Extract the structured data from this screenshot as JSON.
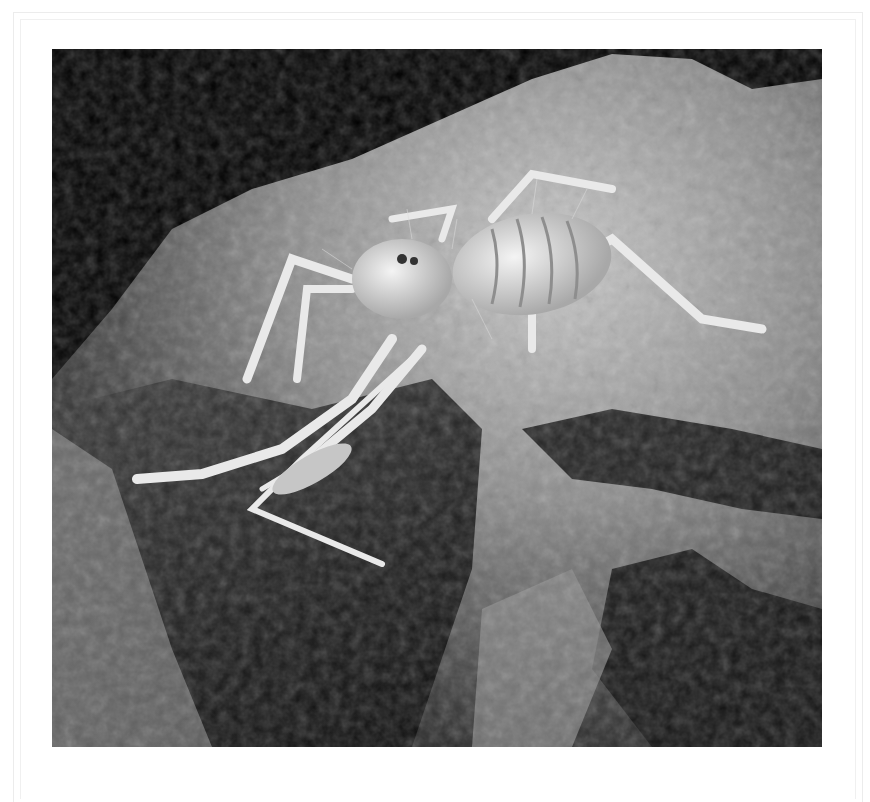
{
  "image": {
    "subject": "Solifuge (camel spider) on a rock, black and white photograph",
    "alt": "Pale, hairy camel spider crawling across a textured rock against a black background",
    "colors": {
      "background": "#ffffff",
      "frame_line": "#ececec",
      "sky": "#000000",
      "rock_light": "#b8b8b8",
      "rock_dark": "#1a1a1a",
      "spider": "#e6e6e6"
    }
  }
}
